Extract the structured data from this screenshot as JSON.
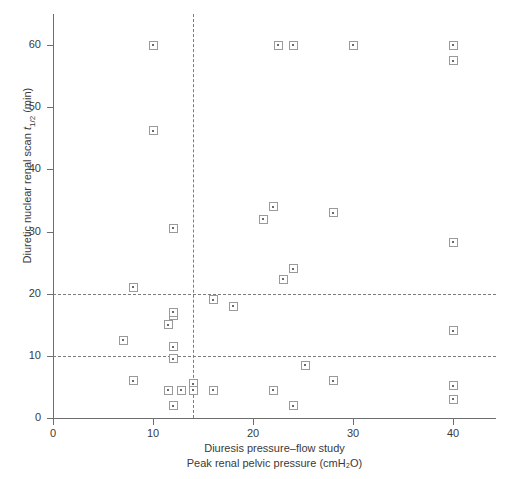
{
  "chart_data": {
    "type": "scatter",
    "title": "",
    "xlabel_lines": [
      "Diuresis pressure–flow study",
      "Peak renal pelvic pressure (cmH₂O)"
    ],
    "ylabel": "Diuretic nuclear renal scan t₁/₂ (min)",
    "ylabel_parts": {
      "prefix": "Diuretic nuclear renal scan ",
      "symbol": "t",
      "subscript": "1/2",
      "units": " (min)"
    },
    "xlim": [
      0,
      44.3
    ],
    "ylim": [
      0,
      65
    ],
    "xticks": [
      0,
      10,
      20,
      30,
      40
    ],
    "yticks": [
      0,
      10,
      20,
      30,
      40,
      50,
      60
    ],
    "xtick_labels": [
      "0",
      "10",
      "20",
      "30",
      "40"
    ],
    "ytick_labels": [
      "0",
      "10",
      "20",
      "30",
      "40",
      "50",
      "60"
    ],
    "grid": false,
    "legend": "none",
    "marker_style": "open-square-with-center-dot",
    "marker_color": "#9a9a9a",
    "axis_color": "#6e6e6e",
    "reference_line_color": "#7c7c7c",
    "reference_lines": {
      "horizontal": [
        10,
        20
      ],
      "vertical": [
        14
      ],
      "style": "dashed"
    },
    "points": [
      {
        "x": 10.0,
        "y": 60.0
      },
      {
        "x": 10.0,
        "y": 46.2
      },
      {
        "x": 12.0,
        "y": 30.5
      },
      {
        "x": 12.0,
        "y": 16.5
      },
      {
        "x": 11.5,
        "y": 15.0
      },
      {
        "x": 12.0,
        "y": 17.0
      },
      {
        "x": 12.0,
        "y": 11.5
      },
      {
        "x": 12.0,
        "y": 9.5
      },
      {
        "x": 7.0,
        "y": 12.5
      },
      {
        "x": 8.0,
        "y": 21.0
      },
      {
        "x": 8.0,
        "y": 6.0
      },
      {
        "x": 11.5,
        "y": 4.5
      },
      {
        "x": 12.8,
        "y": 4.5
      },
      {
        "x": 12.0,
        "y": 2.0
      },
      {
        "x": 14.0,
        "y": 5.5
      },
      {
        "x": 14.0,
        "y": 4.5
      },
      {
        "x": 16.0,
        "y": 19.0
      },
      {
        "x": 16.0,
        "y": 4.5
      },
      {
        "x": 18.0,
        "y": 18.0
      },
      {
        "x": 21.0,
        "y": 32.0
      },
      {
        "x": 22.0,
        "y": 34.0
      },
      {
        "x": 22.5,
        "y": 60.0
      },
      {
        "x": 24.0,
        "y": 60.0
      },
      {
        "x": 23.0,
        "y": 22.3
      },
      {
        "x": 24.0,
        "y": 24.0
      },
      {
        "x": 22.0,
        "y": 4.5
      },
      {
        "x": 24.0,
        "y": 2.0
      },
      {
        "x": 25.2,
        "y": 8.5
      },
      {
        "x": 28.0,
        "y": 33.0
      },
      {
        "x": 28.0,
        "y": 6.0
      },
      {
        "x": 30.0,
        "y": 60.0
      },
      {
        "x": 40.0,
        "y": 60.0
      },
      {
        "x": 40.0,
        "y": 57.5
      },
      {
        "x": 40.0,
        "y": 28.3
      },
      {
        "x": 40.0,
        "y": 14.0
      },
      {
        "x": 40.0,
        "y": 5.2
      },
      {
        "x": 40.0,
        "y": 3.0
      }
    ]
  }
}
